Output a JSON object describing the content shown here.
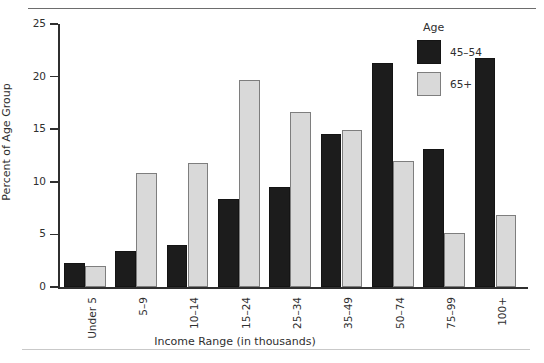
{
  "chart_data": {
    "type": "bar",
    "title": "",
    "xlabel": "Income Range (in thousands)",
    "ylabel": "Percent of Age Group",
    "ylim": [
      0,
      25
    ],
    "yticks": [
      0,
      5,
      10,
      15,
      20,
      25
    ],
    "grid": false,
    "legend": {
      "title": "Age",
      "position": "top-right",
      "entries": [
        {
          "name": "45–54",
          "color": "#1c1c1c"
        },
        {
          "name": "65+",
          "color": "#d9d9d9"
        }
      ]
    },
    "categories": [
      "Under 5",
      "5–9",
      "10–14",
      "15–24",
      "25–34",
      "35–49",
      "50–74",
      "75–99",
      "100+"
    ],
    "series": [
      {
        "name": "45–54",
        "color": "#1c1c1c",
        "values": [
          2.3,
          3.4,
          4.0,
          8.4,
          9.5,
          14.5,
          21.3,
          13.1,
          21.8
        ]
      },
      {
        "name": "65+",
        "color": "#d9d9d9",
        "values": [
          2.0,
          10.8,
          11.8,
          19.7,
          16.6,
          14.9,
          12.0,
          5.1,
          6.8
        ]
      }
    ]
  },
  "yticklabels": [
    "0",
    "5",
    "10",
    "15",
    "20",
    "25"
  ]
}
